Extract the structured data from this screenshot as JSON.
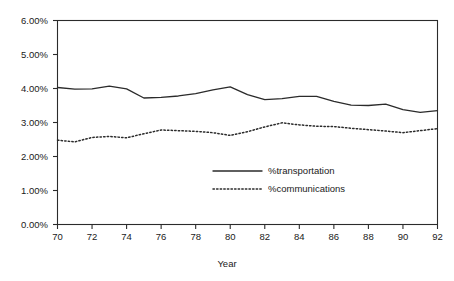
{
  "figure": {
    "title_fragment": "",
    "background": "#ffffff",
    "ink_color": "#2b2b2b"
  },
  "axis_titles": {
    "x": "Year",
    "y": ""
  },
  "legend": {
    "position": "inside-center",
    "entries": [
      {
        "label": "%transportation",
        "style": "solid"
      },
      {
        "label": "%communications",
        "style": "dotted"
      }
    ]
  },
  "y_axis": {
    "ticks": [
      "0.00%",
      "1.00%",
      "2.00%",
      "3.00%",
      "4.00%",
      "5.00%",
      "6.00%"
    ],
    "min": 0,
    "max": 6,
    "step": 1
  },
  "x_axis": {
    "ticks": [
      "70",
      "72",
      "74",
      "76",
      "78",
      "80",
      "82",
      "84",
      "86",
      "88",
      "90",
      "92"
    ],
    "min": 70,
    "max": 92,
    "step": 2
  },
  "chart_data": {
    "type": "line",
    "title": "",
    "xlabel": "Year",
    "ylabel": "",
    "xlim": [
      70,
      92
    ],
    "ylim": [
      0,
      6
    ],
    "ytick_format": "percent",
    "yticks": [
      0,
      1,
      2,
      3,
      4,
      5,
      6
    ],
    "xticks": [
      70,
      72,
      74,
      76,
      78,
      80,
      82,
      84,
      86,
      88,
      90,
      92
    ],
    "grid": false,
    "legend_position": "inside-center",
    "x": [
      70,
      71,
      72,
      73,
      74,
      75,
      76,
      77,
      78,
      79,
      80,
      81,
      82,
      83,
      84,
      85,
      86,
      87,
      88,
      89,
      90,
      91,
      92
    ],
    "series": [
      {
        "name": "%transportation",
        "style": "solid",
        "color": "#2b2b2b",
        "values": [
          4.03,
          3.98,
          3.99,
          4.07,
          3.99,
          3.72,
          3.74,
          3.78,
          3.85,
          3.96,
          4.05,
          3.82,
          3.67,
          3.7,
          3.77,
          3.77,
          3.62,
          3.51,
          3.5,
          3.54,
          3.38,
          3.3,
          3.35
        ]
      },
      {
        "name": "%communications",
        "style": "dotted",
        "color": "#2b2b2b",
        "values": [
          2.48,
          2.43,
          2.56,
          2.59,
          2.55,
          2.67,
          2.78,
          2.76,
          2.74,
          2.7,
          2.62,
          2.73,
          2.87,
          2.99,
          2.93,
          2.89,
          2.88,
          2.83,
          2.79,
          2.75,
          2.7,
          2.76,
          2.82
        ]
      }
    ]
  }
}
